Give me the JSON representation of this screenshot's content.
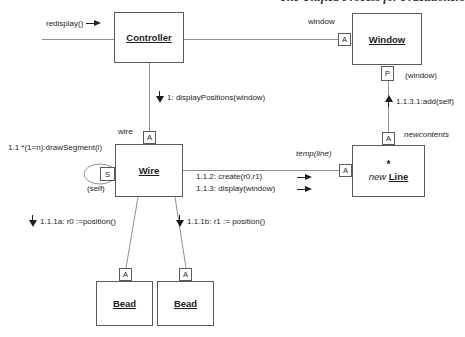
{
  "page": {
    "header_fragment": "The Unified Process for Practitioners"
  },
  "nodes": {
    "controller": {
      "label": "Controller"
    },
    "window": {
      "label": "Window"
    },
    "wire": {
      "label": "Wire"
    },
    "line": {
      "prefix": "new",
      "label": "Line",
      "multiplicity": "*"
    },
    "bead1": {
      "label": "Bead"
    },
    "bead2": {
      "label": "Bead"
    }
  },
  "qualifiers": {
    "window_a": "A",
    "window_p": "P",
    "wire_a": "A",
    "wire_s": "S",
    "line_a_top": "A",
    "line_a_left": "A",
    "bead1_a": "A",
    "bead2_a": "A"
  },
  "messages": {
    "redisplay": "redisplay()",
    "display_positions": "1: displayPositions(window)",
    "draw_segment": "1.1 *(1=n):drawSegment(i)",
    "create": "1.1.2: create(r0,r1)",
    "display_window": "1.1.3: display(window)",
    "add_self": "1.1.3.1:add(self)",
    "r0_position": "1.1.1a: r0 :=position()",
    "r1_position": "1.1.1b: r1 := position()"
  },
  "labels": {
    "window_role": "window",
    "wire_role": "wire",
    "temp_line": "temp(line)",
    "newcontents": "newcontents",
    "self_ref": "(self)",
    "window_ref": "(window)"
  },
  "colors": {
    "background": "#ffffff",
    "connector": "#8f8f8f",
    "border": "#5a5a5a",
    "text": "#1e1e1e"
  }
}
